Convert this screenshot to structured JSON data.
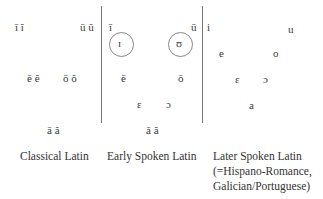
{
  "columns": [
    {
      "caption": [
        "Classical Latin"
      ],
      "vowels": {
        "high_front": "ī ĭ",
        "high_back": "ū ŭ",
        "mid_front": "ē ĕ",
        "mid_back": "ō ŏ",
        "low": "ā ă"
      }
    },
    {
      "caption": [
        "Early Spoken Latin"
      ],
      "vowels": {
        "high_front": "ī",
        "high_back": "ū",
        "near_high_front_circled": "ɪ",
        "near_high_back_circled": "ʊ",
        "mid_front": "ē",
        "mid_back": "ō",
        "open_mid_front": "ɛ",
        "open_mid_back": "ɔ",
        "low": "ā ă"
      }
    },
    {
      "caption": [
        "Later Spoken Latin",
        "(=Hispano-Romance,",
        "Galician/Portuguese)"
      ],
      "vowels": {
        "high_front": "i",
        "high_back": "u",
        "mid_front": "e",
        "mid_back": "o",
        "open_mid_front": "ɛ",
        "open_mid_back": "ɔ",
        "low": "a"
      }
    }
  ]
}
